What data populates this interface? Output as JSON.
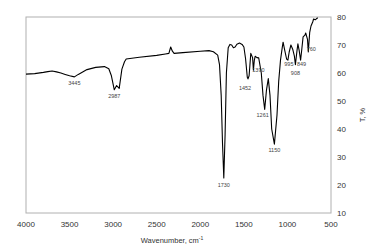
{
  "chart_data": {
    "type": "line",
    "title": "",
    "xlabel": "Wavenumber, cm⁻¹",
    "ylabel": "T, %",
    "xlim": [
      4000,
      500
    ],
    "ylim": [
      10,
      80
    ],
    "x_reversed": true,
    "y_axis_position": "right",
    "grid": false,
    "legend": null,
    "x_ticks": [
      4000,
      3500,
      3000,
      2500,
      2000,
      1500,
      1000,
      500
    ],
    "y_ticks": [
      10,
      20,
      30,
      40,
      50,
      60,
      70,
      80
    ],
    "series": [
      {
        "name": "FTIR spectrum",
        "color": "#000000",
        "x": [
          4000,
          3900,
          3800,
          3750,
          3700,
          3650,
          3600,
          3550,
          3500,
          3445,
          3400,
          3300,
          3200,
          3100,
          3050,
          3020,
          2987,
          2960,
          2930,
          2900,
          2870,
          2850,
          2700,
          2500,
          2400,
          2360,
          2340,
          2320,
          2300,
          2200,
          2000,
          1900,
          1850,
          1800,
          1780,
          1760,
          1745,
          1730,
          1715,
          1700,
          1680,
          1660,
          1640,
          1620,
          1600,
          1580,
          1550,
          1520,
          1500,
          1480,
          1460,
          1452,
          1440,
          1420,
          1400,
          1390,
          1380,
          1370,
          1350,
          1330,
          1300,
          1280,
          1261,
          1240,
          1220,
          1200,
          1180,
          1150,
          1120,
          1100,
          1080,
          1060,
          1050,
          1030,
          1010,
          995,
          980,
          960,
          940,
          920,
          908,
          890,
          880,
          865,
          849,
          835,
          820,
          800,
          790,
          770,
          760,
          745,
          730,
          710,
          700,
          680,
          660,
          650
        ],
        "values": [
          59.6,
          59.8,
          60.2,
          60.5,
          60.7,
          60.4,
          60.0,
          59.5,
          59.0,
          58.6,
          59.5,
          61.2,
          62.0,
          62.3,
          61.5,
          59.0,
          54.0,
          55.5,
          54.5,
          61.4,
          64.0,
          65.0,
          65.6,
          66.3,
          66.8,
          67.0,
          69.3,
          67.8,
          67.0,
          67.3,
          67.8,
          68.0,
          67.6,
          66.4,
          63.0,
          52.0,
          35.0,
          22.5,
          38.0,
          60.0,
          69.0,
          70.2,
          70.0,
          69.0,
          69.3,
          70.3,
          70.7,
          70.2,
          69.3,
          65.0,
          58.5,
          57.9,
          59.0,
          67.0,
          65.5,
          61.0,
          64.5,
          66.0,
          65.5,
          65.4,
          60.0,
          52.0,
          47.0,
          54.0,
          58.0,
          52.0,
          40.0,
          34.6,
          45.0,
          57.0,
          64.6,
          69.0,
          71.0,
          68.0,
          65.0,
          64.6,
          67.5,
          70.0,
          68.5,
          66.0,
          63.0,
          68.0,
          70.4,
          68.0,
          64.6,
          68.5,
          72.9,
          73.5,
          74.3,
          72.0,
          67.5,
          74.5,
          76.8,
          78.2,
          79.3,
          79.0,
          79.6,
          79.6
        ]
      }
    ],
    "annotations": [
      {
        "label": "3445",
        "x": 3445,
        "y": 58.6
      },
      {
        "label": "2987",
        "x": 2987,
        "y": 54.0
      },
      {
        "label": "1730",
        "x": 1730,
        "y": 22.5
      },
      {
        "label": "1452",
        "x": 1452,
        "y": 57.9
      },
      {
        "label": "1390",
        "x": 1390,
        "y": 61.0
      },
      {
        "label": "1261",
        "x": 1261,
        "y": 47.0
      },
      {
        "label": "1150",
        "x": 1150,
        "y": 34.6
      },
      {
        "label": "995",
        "x": 995,
        "y": 64.6
      },
      {
        "label": "908",
        "x": 908,
        "y": 63.0
      },
      {
        "label": "849",
        "x": 849,
        "y": 64.6
      },
      {
        "label": "760",
        "x": 760,
        "y": 67.5
      }
    ]
  },
  "axes": {
    "x_title": "Wavenumber, cm",
    "x_title_sup": "-1",
    "y_title": "T, %"
  },
  "colors": {
    "line": "#000000",
    "frame": "#b0b0b0",
    "text": "#333333"
  }
}
